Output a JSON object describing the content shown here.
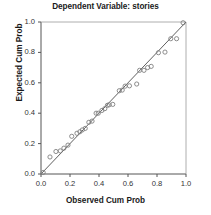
{
  "chart_data": {
    "type": "scatter",
    "title": "Dependent Variable: stories",
    "subtitle": "",
    "xlabel": "Observed Cum Prob",
    "ylabel": "Expected Cum Prob",
    "xlim": [
      0.0,
      1.0
    ],
    "ylim": [
      0.0,
      1.0
    ],
    "xticks": [
      "0.0",
      "0.2",
      "0.4",
      "0.6",
      "0.8",
      "1.0"
    ],
    "yticks": [
      "0.0",
      "0.2",
      "0.4",
      "0.6",
      "0.8",
      "1.0"
    ],
    "xtick_values": [
      0.0,
      0.2,
      0.4,
      0.6,
      0.8,
      1.0
    ],
    "ytick_values": [
      0.0,
      0.2,
      0.4,
      0.6,
      0.8,
      1.0
    ],
    "grid": false,
    "legend": null,
    "legend_position": "none",
    "marker": "open-circle",
    "marker_color": "#808080",
    "reference_line": {
      "name": "identity-line",
      "from": [
        0.0,
        0.0
      ],
      "to": [
        1.0,
        1.0
      ],
      "color": "#4d4d4d"
    },
    "series": [
      {
        "name": "Normal P-P points",
        "x": [
          0.015,
          0.062,
          0.103,
          0.133,
          0.158,
          0.186,
          0.212,
          0.248,
          0.268,
          0.285,
          0.305,
          0.33,
          0.352,
          0.38,
          0.395,
          0.42,
          0.44,
          0.458,
          0.47,
          0.495,
          0.54,
          0.56,
          0.58,
          0.61,
          0.66,
          0.68,
          0.71,
          0.735,
          0.76,
          0.81,
          0.855,
          0.895,
          0.935,
          0.98
        ],
        "y": [
          0.01,
          0.112,
          0.148,
          0.152,
          0.17,
          0.19,
          0.248,
          0.268,
          0.278,
          0.29,
          0.3,
          0.34,
          0.348,
          0.4,
          0.4,
          0.418,
          0.43,
          0.452,
          0.455,
          0.458,
          0.548,
          0.552,
          0.578,
          0.58,
          0.592,
          0.682,
          0.682,
          0.7,
          0.708,
          0.798,
          0.802,
          0.89,
          0.89,
          0.995
        ]
      }
    ]
  },
  "axes": {
    "plot_left_px": 41,
    "plot_top_px": 22,
    "plot_right_px": 186,
    "plot_bottom_px": 174
  }
}
